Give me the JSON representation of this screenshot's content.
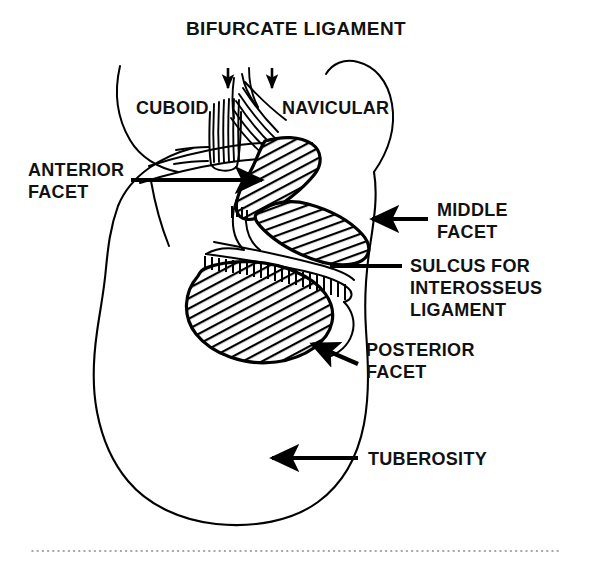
{
  "figure": {
    "title": "BIFURCATE LIGAMENT",
    "background_color": "#ffffff",
    "ink_color": "#000000",
    "bone_labels": {
      "cuboid": "CUBOID",
      "navicular": "NAVICULAR"
    },
    "annotations": {
      "anterior_facet_line1": "ANTERIOR",
      "anterior_facet_line2": "FACET",
      "middle_facet_line1": "MIDDLE",
      "middle_facet_line2": "FACET",
      "sulcus_line1": "SULCUS FOR",
      "sulcus_line2": "INTEROSSEUS",
      "sulcus_line3": "LIGAMENT",
      "posterior_facet_line1": "POSTERIOR",
      "posterior_facet_line2": "FACET",
      "tuberosity": "TUBEROSITY"
    }
  }
}
